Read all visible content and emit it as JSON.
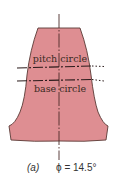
{
  "diagram": {
    "type": "gear-tooth-profile",
    "labels": {
      "pitch_circle": "pitch circle",
      "base_circle": "base circle"
    },
    "caption": {
      "tag": "(a)",
      "equation": "ϕ = 14.5°"
    },
    "colors": {
      "tooth_fill": "#de8e92",
      "tooth_outline": "#5a3a36",
      "centerline": "#4a2a28",
      "reference_lines": "#2a1a1a",
      "text": "#3a2a22"
    },
    "pressure_angle_deg": 14.5
  }
}
